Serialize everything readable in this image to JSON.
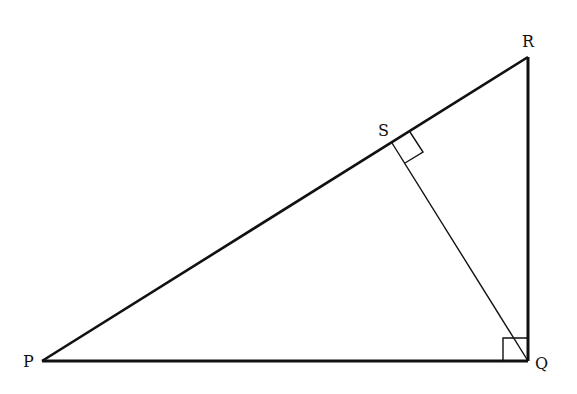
{
  "diagram": {
    "type": "right-triangle-with-altitude",
    "points": {
      "P": {
        "label": "P",
        "x": 42,
        "y": 361
      },
      "Q": {
        "label": "Q",
        "x": 528,
        "y": 361
      },
      "R": {
        "label": "R",
        "x": 528,
        "y": 57
      },
      "S": {
        "label": "S",
        "x": 392,
        "y": 143
      }
    },
    "segments": [
      {
        "from": "P",
        "to": "Q",
        "weight": "thick"
      },
      {
        "from": "Q",
        "to": "R",
        "weight": "thick"
      },
      {
        "from": "P",
        "to": "R",
        "weight": "thick"
      },
      {
        "from": "S",
        "to": "Q",
        "weight": "thin"
      }
    ],
    "right_angles": [
      "Q",
      "S"
    ],
    "labels": {
      "P": "P",
      "Q": "Q",
      "R": "R",
      "S": "S"
    },
    "stroke_color": "#111111"
  }
}
